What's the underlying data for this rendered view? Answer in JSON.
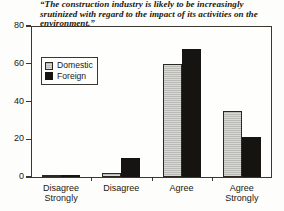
{
  "chart_data": {
    "type": "bar",
    "title": "“The construction industry is likely to be increasingly srutinized with regard to the impact of its activities on the environment.”",
    "xlabel": "",
    "ylabel": "",
    "ylim": [
      0,
      80
    ],
    "yticks": [
      0,
      20,
      40,
      60,
      80
    ],
    "ytick_labels": [
      "0",
      "20",
      "40",
      "60",
      "80"
    ],
    "grid": false,
    "legend_position": "upper left inside plot",
    "categories": [
      "Disagree Strongly",
      "Disagree",
      "Agree",
      "Agree Strongly"
    ],
    "category_lines": [
      [
        "Disagree",
        "Strongly"
      ],
      [
        "Disagree",
        ""
      ],
      [
        "Agree",
        ""
      ],
      [
        "Agree",
        "Strongly"
      ]
    ],
    "series": [
      {
        "name": "Domestic",
        "color": "#b9b9b6",
        "values": [
          1,
          2,
          60,
          35
        ]
      },
      {
        "name": "Foreign",
        "color": "#151411",
        "values": [
          1,
          10,
          68,
          21
        ]
      }
    ]
  },
  "legend": {
    "items": [
      {
        "label": "Domestic",
        "swatch": "light-gray-hatched-swatch"
      },
      {
        "label": "Foreign",
        "swatch": "black-swatch"
      }
    ]
  }
}
